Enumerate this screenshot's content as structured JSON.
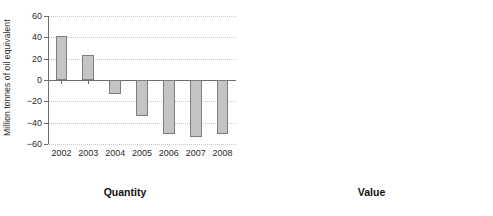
{
  "chart_data": [
    {
      "type": "bar",
      "title": "Quantity",
      "xlabel": "",
      "ylabel": "Million tonnes of oil equivalent",
      "categories": [
        "2002",
        "2003",
        "2004",
        "2005",
        "2006",
        "2007",
        "2008"
      ],
      "values": [
        41,
        23,
        -13,
        -34,
        -51,
        -53,
        -51
      ],
      "ylim": [
        -60,
        60
      ],
      "yticks": [
        60,
        40,
        20,
        0,
        -20,
        -40,
        -60
      ],
      "ytick_labels": [
        "60",
        "40",
        "20",
        "0",
        "−20",
        "−40",
        "−60"
      ],
      "grid": true,
      "legend": "none",
      "bar_fill": "#c4c4c4",
      "bar_border": "#7d7d7d"
    },
    {
      "type": "bar",
      "title": "Value",
      "xlabel": "",
      "ylabel": "£ billion (f.o.b)",
      "categories": [
        "2002",
        "2003",
        "2004",
        "2005",
        "2006",
        "2007",
        "2008"
      ],
      "values": [
        7.9,
        4.2,
        0.4,
        -4.6,
        -5.7,
        -7.2,
        -13.1
      ],
      "ylim": [
        -15,
        10
      ],
      "yticks": [
        10,
        5,
        0,
        -5,
        -10,
        -15
      ],
      "ytick_labels": [
        "10",
        "5",
        "0",
        "−5",
        "−10",
        "−15"
      ],
      "grid": true,
      "legend": "none",
      "bar_fill": "#c4c4c4",
      "bar_border": "#7d7d7d"
    }
  ]
}
